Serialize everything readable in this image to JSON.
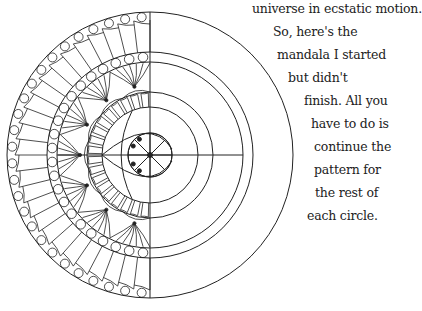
{
  "image": {
    "subject": "half-finished mandala line drawing with handwritten instructions",
    "colors": {
      "background": "#ffffff",
      "ink": "#222222"
    }
  },
  "caption": {
    "lines": [
      {
        "text": "universe in ecstatic motion.",
        "x": 256,
        "y": 0
      },
      {
        "text": "So, here's the",
        "x": 277,
        "y": 23
      },
      {
        "text": "mandala I started",
        "x": 281,
        "y": 46
      },
      {
        "text": "but didn't",
        "x": 292,
        "y": 69
      },
      {
        "text": "finish. All you",
        "x": 308,
        "y": 92
      },
      {
        "text": "have to do is",
        "x": 315,
        "y": 115
      },
      {
        "text": "continue the",
        "x": 318,
        "y": 138
      },
      {
        "text": "pattern for",
        "x": 318,
        "y": 161
      },
      {
        "text": "the rest of",
        "x": 319,
        "y": 184
      },
      {
        "text": "each circle.",
        "x": 311,
        "y": 207
      }
    ]
  },
  "mandala": {
    "center": [
      150,
      155
    ],
    "rings_radii": [
      22,
      48,
      63,
      93,
      103,
      143
    ]
  }
}
